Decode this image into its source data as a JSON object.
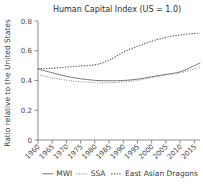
{
  "chart_data": {
    "type": "line",
    "title": "Human Capital Index (US = 1.0)",
    "xlabel": "",
    "ylabel": "Ratio relative to the United States",
    "xlim": [
      1960,
      2017
    ],
    "ylim": [
      0,
      0.8
    ],
    "grid": false,
    "legend_position": "bottom",
    "xticks": [
      "1960",
      "1965",
      "1970",
      "1975",
      "1980",
      "1985",
      "1990",
      "1995",
      "2000",
      "2005",
      "2010",
      "2015"
    ],
    "xtick_values": [
      1960,
      1965,
      1970,
      1975,
      1980,
      1985,
      1990,
      1995,
      2000,
      2005,
      2010,
      2015
    ],
    "yticks": [
      "0",
      "0.2",
      "0.4",
      "0.6",
      "0.8"
    ],
    "ytick_values": [
      0,
      0.2,
      0.4,
      0.6,
      0.8
    ],
    "x": [
      1960,
      1965,
      1970,
      1975,
      1980,
      1985,
      1990,
      1995,
      2000,
      2005,
      2010,
      2015,
      2017
    ],
    "series": [
      {
        "name": "MWI",
        "style": "solid",
        "color": "#7a7a7a",
        "values": [
          0.478,
          0.452,
          0.428,
          0.412,
          0.401,
          0.398,
          0.4,
          0.409,
          0.425,
          0.441,
          0.458,
          0.5,
          0.518
        ]
      },
      {
        "name": "SSA",
        "style": "dotted",
        "color": "#8a8a8a",
        "values": [
          0.44,
          0.418,
          0.402,
          0.391,
          0.385,
          0.384,
          0.39,
          0.402,
          0.42,
          0.437,
          0.452,
          0.478,
          0.492
        ]
      },
      {
        "name": "East Asian Dragons",
        "style": "dashed",
        "color": "#5a5a5a",
        "values": [
          0.48,
          0.482,
          0.49,
          0.498,
          0.505,
          0.536,
          0.59,
          0.63,
          0.664,
          0.69,
          0.706,
          0.716,
          0.718
        ]
      }
    ]
  },
  "legend": {
    "items": [
      {
        "label": "MWI"
      },
      {
        "label": "SSA"
      },
      {
        "label": "East Asian Dragons"
      }
    ]
  }
}
